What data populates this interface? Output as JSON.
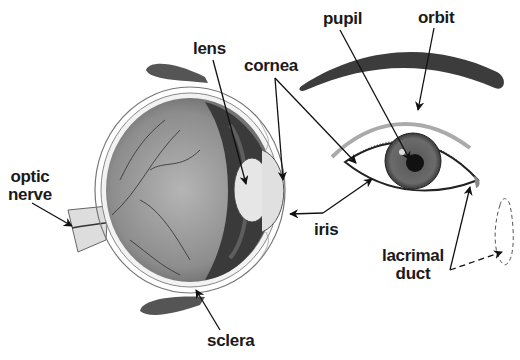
{
  "diagram": {
    "labels": {
      "lens": "lens",
      "cornea": "cornea",
      "pupil": "pupil",
      "orbit": "orbit",
      "optic_nerve_line1": "optic",
      "optic_nerve_line2": "nerve",
      "iris": "iris",
      "lacrimal_duct_line1": "lacrimal",
      "lacrimal_duct_line2": "duct",
      "sclera": "sclera"
    },
    "colors": {
      "background": "#ffffff",
      "label_text": "#1a1a1a",
      "eyeball_interior": "#8a8a8a",
      "iris_ring": "#3a3a3a",
      "lens": "#e6e6e6",
      "eyelid_shape": "#555555",
      "orbit_arc": "#3c3c3c",
      "arrow": "#111111"
    }
  }
}
